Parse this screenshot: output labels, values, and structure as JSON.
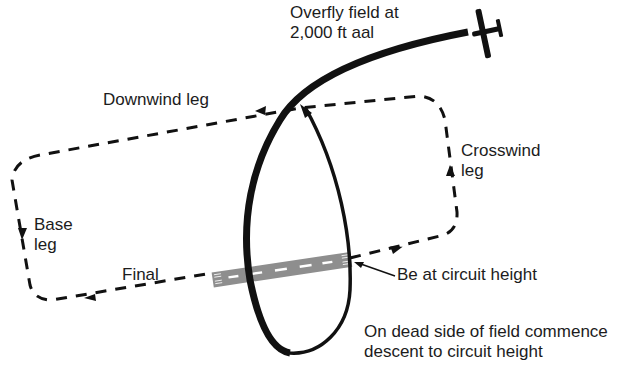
{
  "diagram": {
    "type": "aerodrome overhead-join circuit diagram",
    "labels": {
      "overfly_line1": "Overfly field at",
      "overfly_line2": "2,000 ft aal",
      "downwind": "Downwind leg",
      "crosswind_line1": "Crosswind",
      "crosswind_line2": "leg",
      "base_line1": "Base",
      "base_line2": "leg",
      "final": "Final",
      "circuit_height": "Be at circuit height",
      "dead_side_line1": "On dead side of field commence",
      "dead_side_line2": "descent to circuit height"
    },
    "elements": {
      "circuit_pattern": "dashed rounded rectangle with direction arrows",
      "join_path": "thick curved aircraft track descending in loop",
      "runway": "grey runway with centreline dashes and threshold markings",
      "aircraft": "light aircraft silhouette"
    },
    "colors": {
      "ink": "#111111",
      "runway": "#8e8e8e",
      "runway_marking": "#ffffff",
      "background": "#ffffff"
    }
  }
}
